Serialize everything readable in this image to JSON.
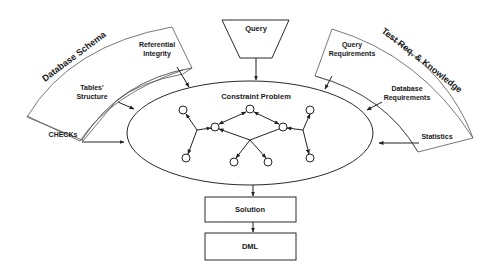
{
  "diagram": {
    "center": {
      "title": "Constraint Problem"
    },
    "query": {
      "label": "Query"
    },
    "left_group": {
      "title": "Database Schema",
      "items": [
        {
          "label_line1": "Referential",
          "label_line2": "Integrity"
        },
        {
          "label_line1": "Tables'",
          "label_line2": "Structure"
        },
        {
          "label_line1": "CHECKs",
          "label_line2": ""
        }
      ]
    },
    "right_group": {
      "title": "Test Req. & Knowledge",
      "items": [
        {
          "label_line1": "Query",
          "label_line2": "Requirements"
        },
        {
          "label_line1": "Database",
          "label_line2": "Requirements"
        },
        {
          "label_line1": "Statistics",
          "label_line2": ""
        }
      ]
    },
    "pipeline": [
      {
        "label": "Solution"
      },
      {
        "label": "DML"
      }
    ],
    "colors": {
      "stroke": "#222222",
      "background": "#ffffff",
      "text": "#1a1a1a"
    }
  }
}
